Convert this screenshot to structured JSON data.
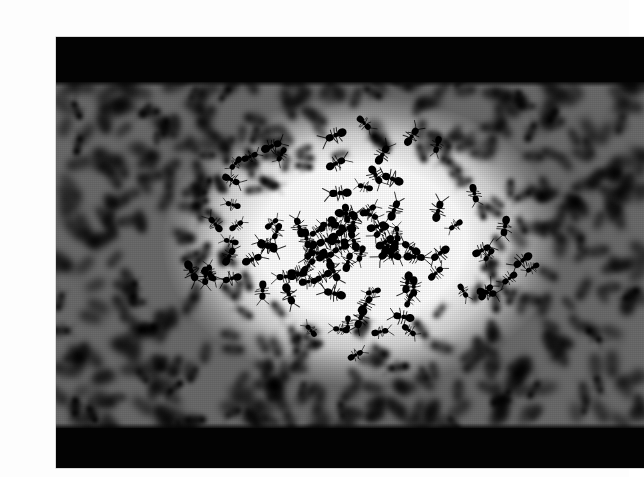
{
  "page": {
    "background_color": "#fdfdfd",
    "width": 629,
    "height": 477,
    "caption": ""
  },
  "photograph": {
    "title": "",
    "alt_text": "Dense swarm of ants photographed in high-contrast black and white",
    "subject": "ant swarm",
    "treatment": "high-contrast black and white",
    "frame": {
      "left": 16,
      "top": 21,
      "width": 588,
      "height": 431,
      "border_color": "#b9b9b9"
    },
    "letterbox": {
      "color": "#030303",
      "top_band_height": 45,
      "bottom_band_height": 40
    },
    "swarm": {
      "background_color": "#ffffff",
      "ink_color": "#000000",
      "focus_center_x_pct": 52,
      "focus_center_y_pct": 46,
      "periphery": "dense, motion-blurred, near-solid black",
      "center": "bright clearing with sharply focused individual ants",
      "approx_visible_ants": 520
    },
    "vignette_opacity": 0.58,
    "grain_opacity": 0.13
  }
}
